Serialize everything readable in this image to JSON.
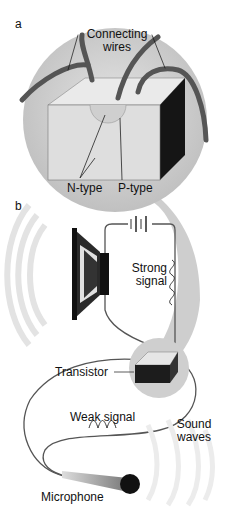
{
  "panel_a": {
    "label": "a",
    "connecting_wires_line1": "Connecting",
    "connecting_wires_line2": "wires",
    "n_type": "N-type",
    "p_type": "P-type"
  },
  "panel_b": {
    "label": "b",
    "strong_signal_line1": "Strong",
    "strong_signal_line2": "signal",
    "transistor": "Transistor",
    "weak_signal": "Weak signal",
    "sound_waves_line1": "Sound",
    "sound_waves_line2": "waves",
    "microphone": "Microphone"
  },
  "colors": {
    "magnifier_fill": "#c9c9c9",
    "wire": "#555555",
    "block_front": "#dcdcdc",
    "block_side": "#1a1a1a",
    "waves": "#e6e6e6"
  }
}
